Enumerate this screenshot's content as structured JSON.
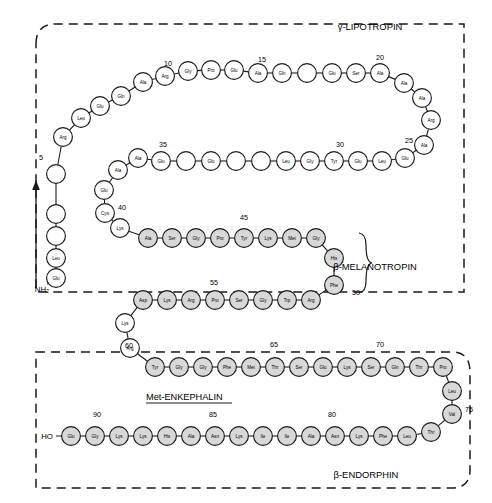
{
  "figure": {
    "title_regions": [
      {
        "key": "gamma_lipotropin",
        "label": "γ-LIPOTROPIN",
        "x": 370,
        "y": 30
      },
      {
        "key": "beta_melanotropin",
        "label": "β-MELANOTROPIN",
        "x": 375,
        "y": 270
      },
      {
        "key": "beta_endorphin",
        "label": "β-ENDORPHIN",
        "x": 366,
        "y": 478
      }
    ],
    "enkephalin_label": {
      "text": "Met-ENKEPHALIN",
      "x": 146,
      "y": 400
    },
    "termini": [
      {
        "key": "n-terminus",
        "text": "NH₂",
        "x": 42,
        "y": 292
      },
      {
        "key": "c-terminus",
        "text": "HO",
        "x": 47,
        "y": 439
      }
    ],
    "position_numbers": [
      {
        "n": "5",
        "x": 41,
        "y": 160
      },
      {
        "n": "10",
        "x": 168,
        "y": 66
      },
      {
        "n": "15",
        "x": 262,
        "y": 62
      },
      {
        "n": "20",
        "x": 380,
        "y": 60
      },
      {
        "n": "25",
        "x": 409,
        "y": 143
      },
      {
        "n": "30",
        "x": 340,
        "y": 147
      },
      {
        "n": "35",
        "x": 163,
        "y": 147
      },
      {
        "n": "40",
        "x": 122,
        "y": 210
      },
      {
        "n": "45",
        "x": 244,
        "y": 220
      },
      {
        "n": "50",
        "x": 356,
        "y": 295
      },
      {
        "n": "55",
        "x": 214,
        "y": 285
      },
      {
        "n": "60",
        "x": 129,
        "y": 348
      },
      {
        "n": "65",
        "x": 274,
        "y": 347
      },
      {
        "n": "70",
        "x": 380,
        "y": 347
      },
      {
        "n": "75",
        "x": 469,
        "y": 412
      },
      {
        "n": "80",
        "x": 332,
        "y": 417
      },
      {
        "n": "85",
        "x": 213,
        "y": 417
      },
      {
        "n": "90",
        "x": 97,
        "y": 417
      }
    ],
    "residues": [
      {
        "i": 1,
        "aa": "Glu",
        "x": 56,
        "y": 278,
        "f": "open"
      },
      {
        "i": 2,
        "aa": "Leu",
        "x": 56,
        "y": 258,
        "f": "open"
      },
      {
        "i": 3,
        "aa": "",
        "x": 56,
        "y": 236,
        "f": "open"
      },
      {
        "i": 4,
        "aa": "",
        "x": 56,
        "y": 214,
        "f": "open"
      },
      {
        "i": 5,
        "aa": "",
        "x": 56,
        "y": 174,
        "f": "open"
      },
      {
        "i": 6,
        "aa": "Arg",
        "x": 63,
        "y": 137,
        "f": "open"
      },
      {
        "i": 7,
        "aa": "Leu",
        "x": 81,
        "y": 118,
        "f": "open"
      },
      {
        "i": 8,
        "aa": "Glu",
        "x": 100,
        "y": 106,
        "f": "open"
      },
      {
        "i": 9,
        "aa": "Gln",
        "x": 121,
        "y": 96,
        "f": "open"
      },
      {
        "i": 10,
        "aa": "Ala",
        "x": 143,
        "y": 82,
        "f": "open"
      },
      {
        "i": 11,
        "aa": "Arg",
        "x": 165,
        "y": 76,
        "f": "open"
      },
      {
        "i": 12,
        "aa": "Gly",
        "x": 188,
        "y": 71,
        "f": "open"
      },
      {
        "i": 13,
        "aa": "Pro",
        "x": 211,
        "y": 70,
        "f": "open"
      },
      {
        "i": 14,
        "aa": "Glu",
        "x": 234,
        "y": 70,
        "f": "open"
      },
      {
        "i": 15,
        "aa": "Ala",
        "x": 258,
        "y": 73,
        "f": "open"
      },
      {
        "i": 16,
        "aa": "Gln",
        "x": 282,
        "y": 73,
        "f": "open"
      },
      {
        "i": 17,
        "aa": "",
        "x": 307,
        "y": 73,
        "f": "open"
      },
      {
        "i": 18,
        "aa": "Glu",
        "x": 332,
        "y": 73,
        "f": "open"
      },
      {
        "i": 19,
        "aa": "Ser",
        "x": 356,
        "y": 73,
        "f": "open"
      },
      {
        "i": 20,
        "aa": "Ala",
        "x": 380,
        "y": 73,
        "f": "open"
      },
      {
        "i": 21,
        "aa": "Ala",
        "x": 404,
        "y": 83,
        "f": "open"
      },
      {
        "i": 22,
        "aa": "Ala",
        "x": 422,
        "y": 98,
        "f": "open"
      },
      {
        "i": 23,
        "aa": "Arg",
        "x": 431,
        "y": 120,
        "f": "open"
      },
      {
        "i": 24,
        "aa": "Ala",
        "x": 424,
        "y": 145,
        "f": "open"
      },
      {
        "i": 25,
        "aa": "Glu",
        "x": 405,
        "y": 158,
        "f": "open"
      },
      {
        "i": 26,
        "aa": "Leu",
        "x": 382,
        "y": 161,
        "f": "open"
      },
      {
        "i": 27,
        "aa": "Glu",
        "x": 358,
        "y": 161,
        "f": "open"
      },
      {
        "i": 28,
        "aa": "Tyr",
        "x": 334,
        "y": 161,
        "f": "open"
      },
      {
        "i": 29,
        "aa": "Gly",
        "x": 310,
        "y": 161,
        "f": "open"
      },
      {
        "i": 30,
        "aa": "Leu",
        "x": 286,
        "y": 161,
        "f": "open"
      },
      {
        "i": 31,
        "aa": "",
        "x": 261,
        "y": 161,
        "f": "open"
      },
      {
        "i": 32,
        "aa": "",
        "x": 236,
        "y": 161,
        "f": "open"
      },
      {
        "i": 33,
        "aa": "Glu",
        "x": 211,
        "y": 161,
        "f": "open"
      },
      {
        "i": 34,
        "aa": "",
        "x": 186,
        "y": 161,
        "f": "open"
      },
      {
        "i": 35,
        "aa": "Glu",
        "x": 161,
        "y": 161,
        "f": "open"
      },
      {
        "i": 36,
        "aa": "Ala",
        "x": 138,
        "y": 158,
        "f": "open"
      },
      {
        "i": 37,
        "aa": "Ala",
        "x": 118,
        "y": 170,
        "f": "open"
      },
      {
        "i": 38,
        "aa": "Glu",
        "x": 104,
        "y": 190,
        "f": "open"
      },
      {
        "i": 39,
        "aa": "Cys",
        "x": 105,
        "y": 213,
        "f": "open"
      },
      {
        "i": 40,
        "aa": "Lys",
        "x": 120,
        "y": 228,
        "f": "open"
      },
      {
        "i": 41,
        "aa": "Ala",
        "x": 148,
        "y": 238,
        "f": "shaded"
      },
      {
        "i": 42,
        "aa": "Ser",
        "x": 172,
        "y": 238,
        "f": "shaded"
      },
      {
        "i": 43,
        "aa": "Gly",
        "x": 196,
        "y": 238,
        "f": "shaded"
      },
      {
        "i": 44,
        "aa": "Pro",
        "x": 220,
        "y": 238,
        "f": "shaded"
      },
      {
        "i": 45,
        "aa": "Tyr",
        "x": 244,
        "y": 238,
        "f": "shaded"
      },
      {
        "i": 46,
        "aa": "Lys",
        "x": 268,
        "y": 238,
        "f": "shaded"
      },
      {
        "i": 47,
        "aa": "Met",
        "x": 292,
        "y": 238,
        "f": "shaded"
      },
      {
        "i": 48,
        "aa": "Gly",
        "x": 316,
        "y": 238,
        "f": "shaded"
      },
      {
        "i": 49,
        "aa": "His",
        "x": 334,
        "y": 258,
        "f": "shaded"
      },
      {
        "i": 50,
        "aa": "Phe",
        "x": 334,
        "y": 285,
        "f": "shaded"
      },
      {
        "i": 51,
        "aa": "Arg",
        "x": 311,
        "y": 300,
        "f": "shaded"
      },
      {
        "i": 52,
        "aa": "Trp",
        "x": 287,
        "y": 300,
        "f": "shaded"
      },
      {
        "i": 53,
        "aa": "Gly",
        "x": 263,
        "y": 300,
        "f": "shaded"
      },
      {
        "i": 54,
        "aa": "Ser",
        "x": 239,
        "y": 300,
        "f": "shaded"
      },
      {
        "i": 55,
        "aa": "Pro",
        "x": 215,
        "y": 300,
        "f": "shaded"
      },
      {
        "i": 56,
        "aa": "Arg",
        "x": 191,
        "y": 300,
        "f": "shaded"
      },
      {
        "i": 57,
        "aa": "Lys",
        "x": 167,
        "y": 300,
        "f": "shaded"
      },
      {
        "i": 58,
        "aa": "Asp",
        "x": 143,
        "y": 300,
        "f": "shaded"
      },
      {
        "i": 59,
        "aa": "Lys",
        "x": 125,
        "y": 323,
        "f": "open"
      },
      {
        "i": 60,
        "aa": "Arg",
        "x": 130,
        "y": 348,
        "f": "open"
      },
      {
        "i": 61,
        "aa": "Tyr",
        "x": 155,
        "y": 367,
        "f": "shaded"
      },
      {
        "i": 62,
        "aa": "Gly",
        "x": 179,
        "y": 367,
        "f": "shaded"
      },
      {
        "i": 63,
        "aa": "Gly",
        "x": 203,
        "y": 367,
        "f": "shaded"
      },
      {
        "i": 64,
        "aa": "Phe",
        "x": 227,
        "y": 367,
        "f": "shaded"
      },
      {
        "i": 65,
        "aa": "Met",
        "x": 251,
        "y": 367,
        "f": "shaded"
      },
      {
        "i": 66,
        "aa": "Thr",
        "x": 275,
        "y": 367,
        "f": "shaded"
      },
      {
        "i": 67,
        "aa": "Ser",
        "x": 299,
        "y": 367,
        "f": "shaded"
      },
      {
        "i": 68,
        "aa": "Glu",
        "x": 323,
        "y": 367,
        "f": "shaded"
      },
      {
        "i": 69,
        "aa": "Lys",
        "x": 347,
        "y": 367,
        "f": "shaded"
      },
      {
        "i": 70,
        "aa": "Ser",
        "x": 371,
        "y": 367,
        "f": "shaded"
      },
      {
        "i": 71,
        "aa": "Gln",
        "x": 395,
        "y": 367,
        "f": "shaded"
      },
      {
        "i": 72,
        "aa": "Thr",
        "x": 419,
        "y": 367,
        "f": "shaded"
      },
      {
        "i": 73,
        "aa": "Pro",
        "x": 443,
        "y": 367,
        "f": "shaded"
      },
      {
        "i": 74,
        "aa": "Leu",
        "x": 452,
        "y": 391,
        "f": "shaded"
      },
      {
        "i": 75,
        "aa": "Val",
        "x": 452,
        "y": 414,
        "f": "shaded"
      },
      {
        "i": 76,
        "aa": "Thr",
        "x": 431,
        "y": 432,
        "f": "shaded"
      },
      {
        "i": 77,
        "aa": "Leu",
        "x": 407,
        "y": 436,
        "f": "shaded"
      },
      {
        "i": 78,
        "aa": "Phe",
        "x": 383,
        "y": 436,
        "f": "shaded"
      },
      {
        "i": 79,
        "aa": "Lys",
        "x": 359,
        "y": 436,
        "f": "shaded"
      },
      {
        "i": 80,
        "aa": "Asn",
        "x": 335,
        "y": 436,
        "f": "shaded"
      },
      {
        "i": 81,
        "aa": "Ala",
        "x": 311,
        "y": 436,
        "f": "shaded"
      },
      {
        "i": 82,
        "aa": "Ile",
        "x": 287,
        "y": 436,
        "f": "shaded"
      },
      {
        "i": 83,
        "aa": "Ile",
        "x": 263,
        "y": 436,
        "f": "shaded"
      },
      {
        "i": 84,
        "aa": "Lys",
        "x": 239,
        "y": 436,
        "f": "shaded"
      },
      {
        "i": 85,
        "aa": "Asn",
        "x": 215,
        "y": 436,
        "f": "shaded"
      },
      {
        "i": 86,
        "aa": "Ala",
        "x": 191,
        "y": 436,
        "f": "shaded"
      },
      {
        "i": 87,
        "aa": "His",
        "x": 167,
        "y": 436,
        "f": "shaded"
      },
      {
        "i": 88,
        "aa": "Lys",
        "x": 143,
        "y": 436,
        "f": "shaded"
      },
      {
        "i": 89,
        "aa": "Lys",
        "x": 119,
        "y": 436,
        "f": "shaded"
      },
      {
        "i": 90,
        "aa": "Gly",
        "x": 95,
        "y": 436,
        "f": "shaded"
      },
      {
        "i": 91,
        "aa": "Glu",
        "x": 71,
        "y": 436,
        "f": "shaded"
      }
    ],
    "colors": {
      "stroke": "#1a1a1a",
      "open_fill": "#ffffff",
      "shaded_fill": "#d8d8d8",
      "background": "#ffffff"
    }
  }
}
